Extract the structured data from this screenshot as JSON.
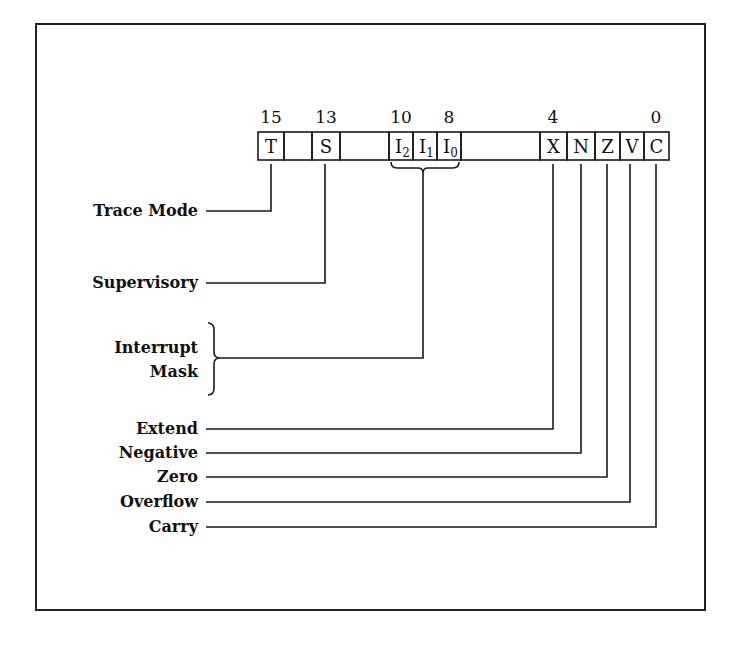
{
  "diagram": {
    "bit_numbers": [
      {
        "label": "15",
        "x": 271
      },
      {
        "label": "13",
        "x": 326
      },
      {
        "label": "10",
        "x": 401
      },
      {
        "label": "8",
        "x": 449
      },
      {
        "label": "4",
        "x": 553
      },
      {
        "label": "0",
        "x": 656
      }
    ],
    "cells": [
      {
        "id": "T",
        "label": "T",
        "sub": "",
        "x": 258,
        "w": 26,
        "hatched": false
      },
      {
        "id": "r14",
        "label": "",
        "sub": "",
        "x": 284,
        "w": 28,
        "hatched": true
      },
      {
        "id": "S",
        "label": "S",
        "sub": "",
        "x": 312,
        "w": 28,
        "hatched": false
      },
      {
        "id": "r12_11",
        "label": "",
        "sub": "",
        "x": 340,
        "w": 49,
        "hatched": true
      },
      {
        "id": "I2",
        "label": "I",
        "sub": "2",
        "x": 389,
        "w": 24,
        "hatched": false
      },
      {
        "id": "I1",
        "label": "I",
        "sub": "1",
        "x": 413,
        "w": 24,
        "hatched": false
      },
      {
        "id": "I0",
        "label": "I",
        "sub": "0",
        "x": 437,
        "w": 24,
        "hatched": false
      },
      {
        "id": "r7_5",
        "label": "",
        "sub": "",
        "x": 461,
        "w": 79,
        "hatched": true
      },
      {
        "id": "X",
        "label": "X",
        "sub": "",
        "x": 540,
        "w": 27,
        "hatched": false
      },
      {
        "id": "N",
        "label": "N",
        "sub": "",
        "x": 567,
        "w": 28,
        "hatched": false
      },
      {
        "id": "Z",
        "label": "Z",
        "sub": "",
        "x": 595,
        "w": 25,
        "hatched": false
      },
      {
        "id": "V",
        "label": "V",
        "sub": "",
        "x": 620,
        "w": 24,
        "hatched": false
      },
      {
        "id": "C",
        "label": "C",
        "sub": "",
        "x": 644,
        "w": 25,
        "hatched": false
      }
    ],
    "labels": {
      "trace": "Trace Mode",
      "supervisory": "Supervisory",
      "interrupt_line1": "Interrupt",
      "interrupt_line2": "Mask",
      "extend": "Extend",
      "negative": "Negative",
      "zero": "Zero",
      "overflow": "Overflow",
      "carry": "Carry"
    },
    "colors": {
      "line": "#1a1a1a",
      "background": "#ffffff"
    }
  }
}
